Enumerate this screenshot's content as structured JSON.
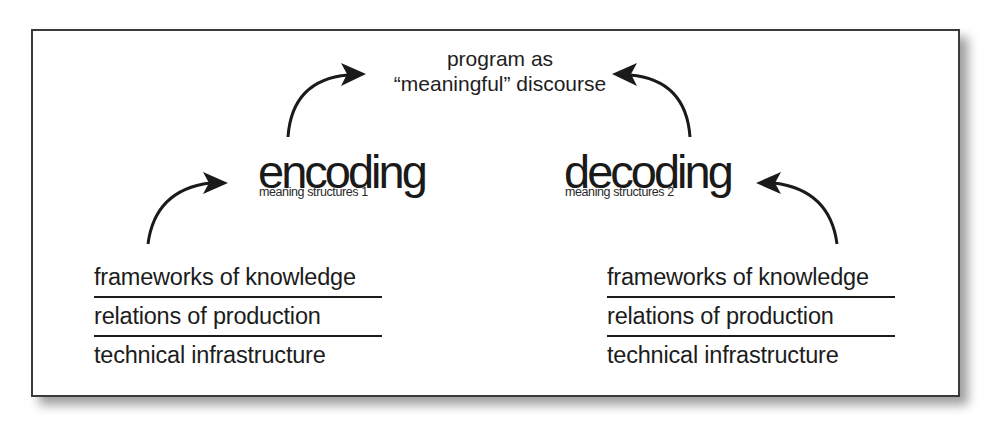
{
  "diagram": {
    "title_node": {
      "line1": "program as",
      "line2": "“meaningful” discourse"
    },
    "encoding": {
      "title": "encoding",
      "subtitle": "meaning structures 1"
    },
    "decoding": {
      "title": "decoding",
      "subtitle": "meaning structures 2"
    },
    "left_stack": {
      "items": [
        "frameworks of knowledge",
        "relations of production",
        "technical infrastructure"
      ]
    },
    "right_stack": {
      "items": [
        "frameworks of knowledge",
        "relations of production",
        "technical infrastructure"
      ]
    },
    "arrows": [
      {
        "from": "left_stack",
        "to": "encoding"
      },
      {
        "from": "encoding",
        "to": "title_node"
      },
      {
        "from": "decoding",
        "to": "title_node"
      },
      {
        "from": "right_stack",
        "to": "decoding"
      }
    ],
    "colors": {
      "ink": "#1c1c1c",
      "frame_border": "#3a3a3a",
      "background": "#ffffff"
    }
  }
}
